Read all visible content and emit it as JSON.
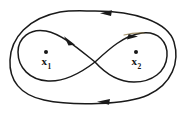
{
  "figure": {
    "background_color": "#ffffff",
    "stroke_color": "#1a1a1a",
    "accent_color": "#8a7340",
    "width": 190,
    "height": 114
  },
  "points": [
    {
      "id": "x1",
      "name": "point-x1",
      "symbol": "x",
      "subscript": "1",
      "dot_color": "#161616",
      "x": 45,
      "y": 53
    },
    {
      "id": "x2",
      "name": "point-x2",
      "symbol": "x",
      "subscript": "2",
      "dot_color": "#161616",
      "x": 136,
      "y": 53
    }
  ],
  "curves": [
    {
      "id": "outer-loop",
      "name": "outer-closed-curve",
      "description": "Large outer closed oval enclosing both points",
      "direction": "clockwise-leftward-on-top"
    },
    {
      "id": "figure-eight",
      "name": "inner-figure-eight-curve",
      "description": "Inner lemniscate crossing near the centre between the two points",
      "crossing_point": {
        "x": 95,
        "y": 62
      }
    }
  ],
  "arrows": [
    {
      "id": "arrow-top-outer",
      "name": "arrowhead-top-outer",
      "x": 105,
      "y": 14,
      "direction": "left"
    },
    {
      "id": "arrow-bottom-outer",
      "name": "arrowhead-bottom-outer",
      "x": 105,
      "y": 101,
      "direction": "left"
    },
    {
      "id": "arrow-inner-left",
      "name": "arrowhead-inner-left",
      "x": 70,
      "y": 42,
      "direction": "up-left"
    },
    {
      "id": "arrow-inner-right",
      "name": "arrowhead-inner-right",
      "x": 133,
      "y": 39,
      "direction": "right"
    }
  ]
}
